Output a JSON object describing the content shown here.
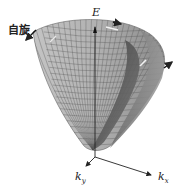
{
  "diagram": {
    "type": "3d-band-structure",
    "labels": {
      "spin": "自旋",
      "energy_axis": "E",
      "kx_main": "k",
      "kx_sub": "x",
      "ky_main": "k",
      "ky_sub": "y"
    },
    "colors": {
      "outer_surface": "#a8a8a8",
      "inner_surface": "#5a5a5a",
      "grid": "#555555",
      "axis": "#222222"
    }
  }
}
